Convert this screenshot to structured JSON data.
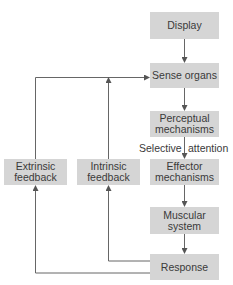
{
  "diagram": {
    "boxes": {
      "display": "Display",
      "sense_organs": "Sense organs",
      "perceptual_1": "Perceptual",
      "perceptual_2": "mechanisms",
      "effector_1": "Effector",
      "effector_2": "mechanisms",
      "muscular_1": "Muscular",
      "muscular_2": "system",
      "response": "Response",
      "extrinsic_1": "Extrinsic",
      "extrinsic_2": "feedback",
      "intrinsic_1": "Intrinsic",
      "intrinsic_2": "feedback"
    },
    "annotations": {
      "selective": "Selective",
      "attention": "attention"
    },
    "edges": [
      {
        "from": "Display",
        "to": "Sense organs"
      },
      {
        "from": "Sense organs",
        "to": "Perceptual mechanisms"
      },
      {
        "from": "Perceptual mechanisms",
        "to": "Effector mechanisms",
        "label": "Selective attention"
      },
      {
        "from": "Effector mechanisms",
        "to": "Muscular system"
      },
      {
        "from": "Muscular system",
        "to": "Response"
      },
      {
        "from": "Response",
        "to": "Intrinsic feedback"
      },
      {
        "from": "Response",
        "to": "Extrinsic feedback"
      },
      {
        "from": "Intrinsic feedback",
        "to": "Sense organs"
      },
      {
        "from": "Extrinsic feedback",
        "to": "Sense organs"
      }
    ],
    "colors": {
      "box_fill": "#d5d5d5",
      "line": "#555555",
      "text": "#3a3a3a"
    }
  }
}
